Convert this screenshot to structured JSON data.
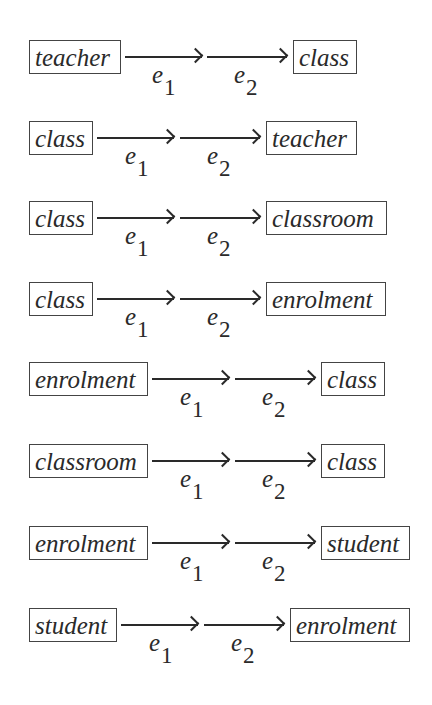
{
  "diagram": {
    "edge_labels": {
      "first": "e",
      "first_sub": "1",
      "second": "e",
      "second_sub": "2"
    },
    "rows": [
      {
        "source": "teacher",
        "target": "class"
      },
      {
        "source": "class",
        "target": "teacher"
      },
      {
        "source": "class",
        "target": "classroom"
      },
      {
        "source": "class",
        "target": "enrolment"
      },
      {
        "source": "enrolment",
        "target": "class"
      },
      {
        "source": "classroom",
        "target": "class"
      },
      {
        "source": "enrolment",
        "target": "student"
      },
      {
        "source": "student",
        "target": "enrolment"
      }
    ]
  }
}
